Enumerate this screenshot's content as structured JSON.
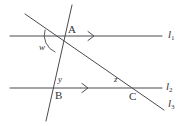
{
  "figure": {
    "kind": "geometry-diagram",
    "width": 186,
    "height": 126,
    "background_color": "#ffffff",
    "stroke_color": "#4a4a50",
    "text_color": "#35353a"
  },
  "points": [
    {
      "id": "A",
      "label": "A",
      "x": 62,
      "y": 37,
      "label_x": 68,
      "label_y": 24
    },
    {
      "id": "B",
      "label": "B",
      "x": 57,
      "y": 88,
      "label_x": 55,
      "label_y": 90
    },
    {
      "id": "C",
      "label": "C",
      "x": 136,
      "y": 88,
      "label_x": 129,
      "label_y": 91
    }
  ],
  "lines": [
    {
      "id": "l1",
      "label": "l",
      "subscript": "1",
      "kind": "parallel-line",
      "x1": 10,
      "y1": 36,
      "x2": 162,
      "y2": 36,
      "label_x": 168,
      "label_y": 29,
      "tick_arrow": {
        "x": 92,
        "y": 36,
        "direction": "right"
      }
    },
    {
      "id": "l2",
      "label": "l",
      "subscript": "2",
      "kind": "parallel-line",
      "x1": 10,
      "y1": 88,
      "x2": 162,
      "y2": 88,
      "label_x": 166,
      "label_y": 81,
      "tick_arrow": {
        "x": 86,
        "y": 88,
        "direction": "right"
      }
    },
    {
      "id": "l3",
      "label": "l",
      "subscript": "3",
      "kind": "transversal",
      "x1": 25,
      "y1": 14,
      "x2": 164,
      "y2": 110,
      "label_x": 168,
      "label_y": 98
    },
    {
      "id": "t2",
      "label": "",
      "subscript": "",
      "kind": "transversal",
      "x1": 72,
      "y1": 5,
      "x2": 46,
      "y2": 121,
      "label_x": 0,
      "label_y": 0
    }
  ],
  "angles": [
    {
      "id": "w",
      "label": "w",
      "vertex": "A",
      "label_x": 39,
      "label_y": 43,
      "arc": true
    },
    {
      "id": "y",
      "label": "y",
      "vertex": "B",
      "label_x": 58,
      "label_y": 75,
      "arc": false
    },
    {
      "id": "z",
      "label": "z",
      "vertex": "C",
      "label_x": 114,
      "label_y": 75,
      "arc": false
    }
  ]
}
